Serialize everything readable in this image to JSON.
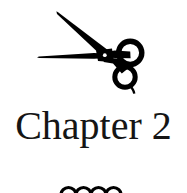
{
  "page": {
    "background_color": "#ffffff",
    "ink_color": "#000000",
    "width": 187,
    "height": 193
  },
  "ornaments": {
    "top": {
      "icon_name": "scissors-icon",
      "description": "barber shears silhouette",
      "color": "#000000"
    },
    "bottom": {
      "icon_name": "scalloped-wave-rule-icon",
      "description": "decorative wavy scallop divider",
      "arc_count": 4,
      "color": "#000000"
    }
  },
  "chapter": {
    "title": "Chapter 2",
    "label_word": "Chapter",
    "number": "2",
    "color": "#151515"
  }
}
